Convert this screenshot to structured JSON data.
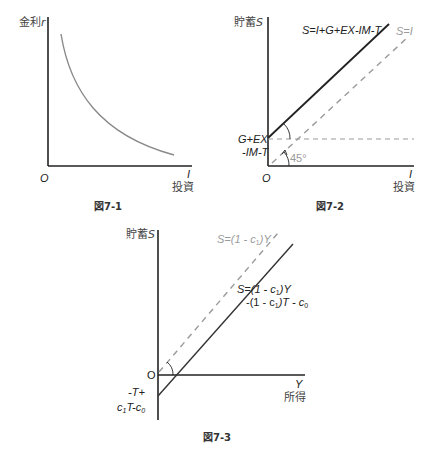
{
  "figures": [
    {
      "id": "fig7-1",
      "caption": "図7-1",
      "y_axis_label_jp": "金利",
      "y_axis_var": "r",
      "x_axis_var": "I",
      "x_axis_label_jp": "投資",
      "origin": "O",
      "curve": "downward-sloping convex investment demand curve"
    },
    {
      "id": "fig7-2",
      "caption": "図7-2",
      "y_axis_label_jp": "貯蓄",
      "y_axis_var": "S",
      "x_axis_var": "I",
      "x_axis_label_jp": "投資",
      "origin": "O",
      "solid_line_label": "S=I+G+EX-IM-T",
      "dashed_line_label": "S=I",
      "intercept_label_line1": "G+EX",
      "intercept_label_line2": "-IM-T",
      "angle_label": "45°"
    },
    {
      "id": "fig7-3",
      "caption": "図7-3",
      "y_axis_label_jp": "貯蓄",
      "y_axis_var": "S",
      "x_axis_var": "Y",
      "x_axis_label_jp": "所得",
      "origin": "O",
      "dashed_line_label": {
        "pre": "S=(1 - c",
        "sub": "1",
        "post": ")Y"
      },
      "solid_line_label_line1": {
        "pre": "S=(1 - c",
        "sub": "1",
        "post": ")Y"
      },
      "solid_line_label_line2": {
        "pre": "-(1 - c",
        "sub1": "1",
        "mid": ")T - c",
        "sub2": "0"
      },
      "intercept_label_line1": "-T+",
      "intercept_label_line2": {
        "pre": "c",
        "sub1": "1",
        "mid": "T-c",
        "sub2": "0"
      }
    }
  ],
  "colors": {
    "axis": "#222222",
    "solid_line": "#222222",
    "curve": "#8a8a8a",
    "dashed_line": "#9a9a9a",
    "gray_label": "#9a9a9a"
  }
}
